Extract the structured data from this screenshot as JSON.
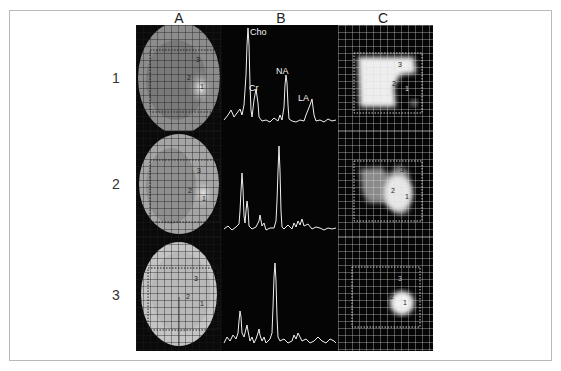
{
  "figure": {
    "column_labels": [
      "A",
      "B",
      "C"
    ],
    "row_labels": [
      "1",
      "2",
      "3"
    ],
    "panels": {
      "A": {
        "description": "MRI slices with spectroscopic voxel grid",
        "roi_labels": [
          "3",
          "2",
          "1"
        ]
      },
      "B": {
        "description": "MR spectra",
        "peak_labels": [
          "Cho",
          "Cr",
          "NA",
          "LA"
        ]
      },
      "C": {
        "description": "Metabolite maps with grid",
        "roi_labels": [
          "3",
          "2",
          "1"
        ]
      }
    }
  },
  "colors": {
    "background": "#ffffff",
    "frame_border": "#b9b9b9",
    "panel_black": "#050505",
    "grid_line": "#d8d8d8",
    "spectrum_line": "#f0f0f0"
  }
}
